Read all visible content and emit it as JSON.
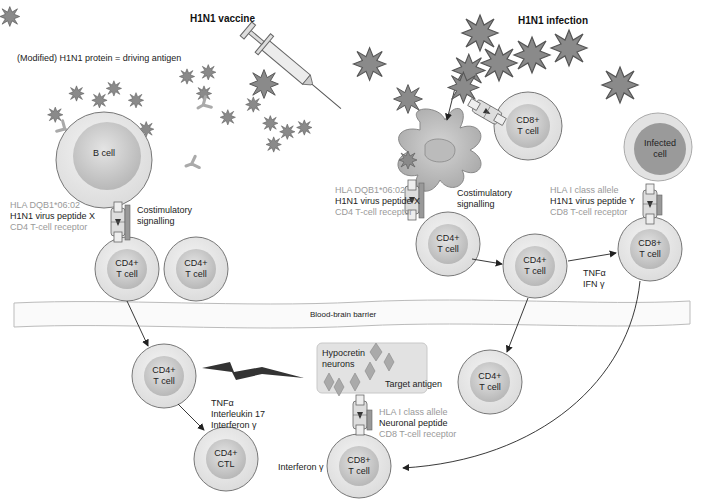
{
  "headers": {
    "vaccine": "H1N1 vaccine",
    "infection": "H1N1 infection"
  },
  "antigen_note": "(Modified) H1N1 protein = driving antigen",
  "barrier_label": "Blood-brain barrier",
  "cells": {
    "b_cell": "B cell",
    "cd8_top": [
      "CD8+",
      "T cell"
    ],
    "infected": [
      "Infected",
      "cell"
    ],
    "cd4_left_a": [
      "CD4+",
      "T cell"
    ],
    "cd4_left_b": [
      "CD4+",
      "T cell"
    ],
    "cd4_dc": [
      "CD4+",
      "T cell"
    ],
    "cd4_mid": [
      "CD4+",
      "T cell"
    ],
    "cd8_right": [
      "CD8+",
      "T cell"
    ],
    "cd4_brain_left": [
      "CD4+",
      "T cell"
    ],
    "cd4_ctl": [
      "CD4+",
      "CTL"
    ],
    "cd8_brain": [
      "CD8+",
      "T cell"
    ],
    "cd4_brain_right": [
      "CD4+",
      "T cell"
    ]
  },
  "receptor_labels": {
    "left": {
      "hla": "HLA DQB1*06:02",
      "peptide": "H1N1 virus peptide X",
      "tcr": "CD4 T-cell receptor",
      "costim": [
        "Costimulatory",
        "signalling"
      ]
    },
    "dc": {
      "hla": "HLA DQB1*06:02",
      "peptide": "H1N1 virus peptide X",
      "tcr": "CD4 T-cell receptor",
      "costim": [
        "Costimulatory",
        "signalling"
      ]
    },
    "infected": {
      "hla": "HLA I class allele",
      "peptide": "H1N1 virus peptide Y",
      "tcr": "CD8 T-cell receptor"
    },
    "brain": {
      "hla": "HLA I class allele",
      "peptide": "Neuronal peptide",
      "tcr": "CD8 T-cell receptor"
    }
  },
  "cytokines": {
    "mid": [
      "TNFα",
      "IFN γ"
    ],
    "ctl": [
      "TNFα",
      "Interleukin 17",
      "Interferon γ"
    ],
    "cd8_brain": "Interferon γ"
  },
  "neurons": {
    "label": [
      "Hypocretin",
      "neurons"
    ],
    "target": "Target antigen"
  },
  "colors": {
    "cell_outer": "#e6e6e6",
    "cell_inner": "#c4c4c4",
    "virus": "#8c8c8c",
    "stroke": "#555555",
    "grey_text": "#999999"
  }
}
